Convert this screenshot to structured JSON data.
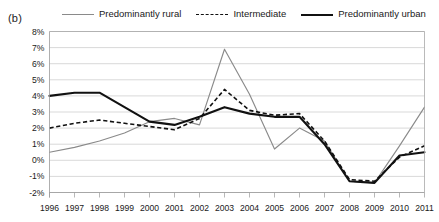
{
  "panel": {
    "label": "(b)"
  },
  "legend": {
    "position": "top",
    "items": [
      {
        "name": "Predominantly rural",
        "style": "solid-thin-gray",
        "color": "#8a8a8a"
      },
      {
        "name": "Intermediate",
        "style": "dashed-black",
        "color": "#111111"
      },
      {
        "name": "Predominantly urban",
        "style": "solid-thick-black",
        "color": "#111111"
      }
    ]
  },
  "chart_data": {
    "type": "line",
    "title": "",
    "subtitle": "",
    "xlabel": "",
    "ylabel": "",
    "x": [
      1996,
      1997,
      1998,
      1999,
      2000,
      2001,
      2002,
      2003,
      2004,
      2005,
      2006,
      2007,
      2008,
      2009,
      2010,
      2011
    ],
    "categories": [
      "1996",
      "1997",
      "1998",
      "1999",
      "2000",
      "2001",
      "2002",
      "2003",
      "2004",
      "2005",
      "2006",
      "2007",
      "2008",
      "2009",
      "2010",
      "2011"
    ],
    "ylim": [
      -2,
      8
    ],
    "yticks": [
      -2,
      -1,
      0,
      1,
      2,
      3,
      4,
      5,
      6,
      7,
      8
    ],
    "ytick_labels": [
      "-2%",
      "-1%",
      "0%",
      "1%",
      "2%",
      "3%",
      "4%",
      "5%",
      "6%",
      "7%",
      "8%"
    ],
    "y_unit": "%",
    "grid": true,
    "legend_position": "top",
    "series": [
      {
        "name": "Predominantly rural",
        "color": "#8a8a8a",
        "style": "solid",
        "values": [
          0.5,
          0.8,
          1.2,
          1.7,
          2.4,
          2.6,
          2.2,
          6.9,
          4.1,
          0.7,
          2.0,
          1.2,
          -1.3,
          -1.4,
          0.9,
          3.3
        ]
      },
      {
        "name": "Intermediate",
        "color": "#111111",
        "style": "dashed",
        "values": [
          2.0,
          2.3,
          2.5,
          2.3,
          2.1,
          1.9,
          2.6,
          4.4,
          3.1,
          2.8,
          2.9,
          1.2,
          -1.2,
          -1.3,
          0.2,
          0.9
        ]
      },
      {
        "name": "Predominantly urban",
        "color": "#111111",
        "style": "solid",
        "values": [
          4.0,
          4.2,
          4.2,
          3.3,
          2.4,
          2.2,
          2.7,
          3.3,
          2.9,
          2.7,
          2.7,
          1.0,
          -1.3,
          -1.4,
          0.3,
          0.5
        ]
      }
    ]
  }
}
